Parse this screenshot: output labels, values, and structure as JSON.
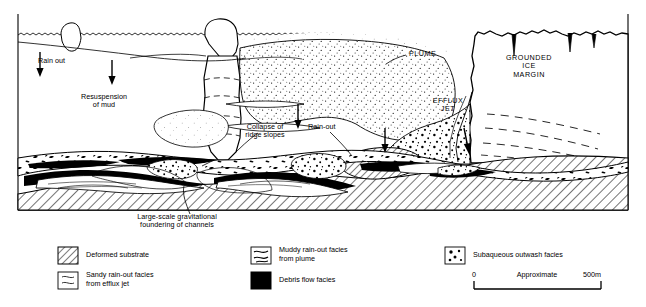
{
  "figure": {
    "diagram_labels": [
      {
        "id": "rain-out-left",
        "text": "Rain out",
        "x": 38,
        "y": 60,
        "align": "left"
      },
      {
        "id": "resuspension",
        "text": "Resuspension\nof mud",
        "x": 104,
        "y": 97,
        "align": "center"
      },
      {
        "id": "collapse-ridge",
        "text": "Collapse of\nridge slopes",
        "x": 265,
        "y": 127,
        "align": "center"
      },
      {
        "id": "rain-out-mid",
        "text": "Rain-out",
        "x": 308,
        "y": 126,
        "align": "left"
      },
      {
        "id": "plume",
        "text": "PLUME",
        "x": 408,
        "y": 52,
        "align": "left"
      },
      {
        "id": "efflux-jet",
        "text": "EFFLUX\nJET",
        "x": 448,
        "y": 100,
        "align": "center"
      },
      {
        "id": "grounded-ice",
        "text": "GROUNDED\nICE\nMARGIN",
        "x": 529,
        "y": 58,
        "align": "center"
      },
      {
        "id": "foundering",
        "text": "Large-scale gravitational\nfoundering of channels",
        "x": 176,
        "y": 216,
        "align": "center"
      }
    ]
  },
  "legend": {
    "items": [
      {
        "id": "deformed-substrate",
        "label": "Deformed substrate",
        "swatch": "diagonal-hatch",
        "col": 1,
        "row": 1
      },
      {
        "id": "sandy-rain-out",
        "label": "Sandy rain-out facies\nfrom efflux jet",
        "swatch": "wavy-lines",
        "col": 1,
        "row": 2
      },
      {
        "id": "muddy-rain-out",
        "label": "Muddy rain-out facies\nfrom plume",
        "swatch": "mud-wisps",
        "col": 2,
        "row": 1
      },
      {
        "id": "debris-flow",
        "label": "Debris flow facies",
        "swatch": "solid-black",
        "col": 2,
        "row": 2
      },
      {
        "id": "subaqueous-outwash",
        "label": "Subaqueous outwash facies",
        "swatch": "gravel-dots",
        "col": 3,
        "row": 1
      }
    ]
  },
  "scale_bar": {
    "left_label": "0",
    "center_label": "Approximate",
    "right_label": "500m"
  },
  "colors": {
    "ink": "#000000",
    "paper": "#ffffff",
    "plume_fill": "#f2f2f2",
    "hatch": "#000000"
  }
}
